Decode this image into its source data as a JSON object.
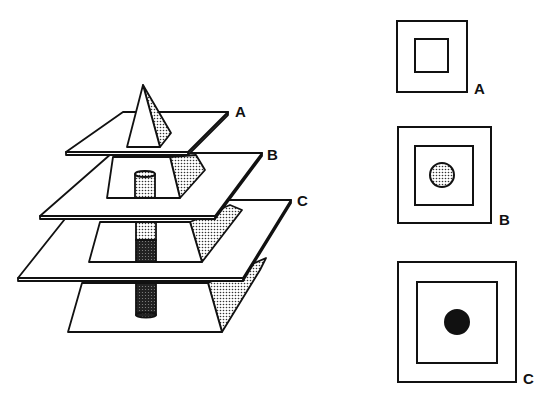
{
  "figure": {
    "left_diagram": {
      "description": "Stacked pyramid sliced by three horizontal planes with an internal cylinder",
      "planes": [
        {
          "id": "A",
          "label": "A"
        },
        {
          "id": "B",
          "label": "B"
        },
        {
          "id": "C",
          "label": "C"
        }
      ]
    },
    "right_diagram": {
      "description": "Cross sections at planes A, B, C",
      "sections": [
        {
          "id": "A",
          "label": "A",
          "inner_shape": "square",
          "circle": "none"
        },
        {
          "id": "B",
          "label": "B",
          "inner_shape": "square",
          "circle": "stippled"
        },
        {
          "id": "C",
          "label": "C",
          "inner_shape": "square",
          "circle": "solid"
        }
      ]
    },
    "colors": {
      "ink": "#111111",
      "paper": "#ffffff",
      "stipple": "#9a9a9a"
    }
  }
}
